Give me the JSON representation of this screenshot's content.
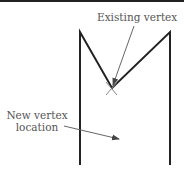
{
  "diagram": {
    "labels": {
      "existing_vertex": "Existing vertex",
      "new_vertex_line1": "New vertex",
      "new_vertex_line2": "location"
    },
    "colors": {
      "shape_stroke": "#222222",
      "arrow_stroke": "#666666",
      "text": "#555555"
    }
  }
}
